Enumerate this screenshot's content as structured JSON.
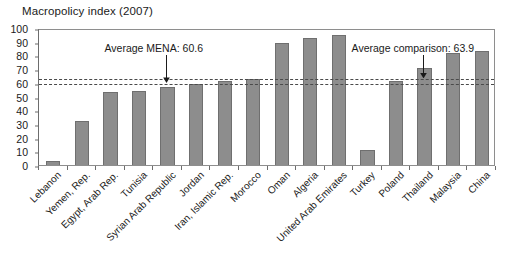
{
  "chart_data": {
    "type": "bar",
    "title": "Macropolicy index (2007)",
    "xlabel": "",
    "ylabel": "",
    "ylim": [
      0,
      100
    ],
    "ytick_step": 10,
    "yticks": [
      0,
      10,
      20,
      30,
      40,
      50,
      60,
      70,
      80,
      90,
      100
    ],
    "grid": false,
    "legend": "none",
    "bar_color": "#8d8d8d",
    "bar_edge_color": "#6f6f6f",
    "categories": [
      "Lebanon",
      "Yemen, Rep.",
      "Egypt, Arab Rep.",
      "Tunisia",
      "Syrian Arab Republic",
      "Jordan",
      "Iran, Islamic Rep.",
      "Morocco",
      "Oman",
      "Algeria",
      "United Arab Emirates",
      "Turkey",
      "Poland",
      "Thailand",
      "Malaysia",
      "China"
    ],
    "values": [
      3,
      32,
      53,
      54,
      57,
      59,
      61,
      63,
      89,
      93,
      95,
      11,
      61,
      71,
      82,
      83
    ],
    "reference_lines": [
      {
        "name": "Average MENA",
        "label": "Average MENA: 60.6",
        "value": 60.6,
        "style": "dashed",
        "color": "#4a4a4a",
        "annotation_x_category": "Syrian Arab Republic"
      },
      {
        "name": "Average comparison",
        "label": "Average comparison: 63.9",
        "value": 63.9,
        "style": "dashed",
        "color": "#4a4a4a",
        "annotation_x_category": "Thailand"
      }
    ]
  },
  "annotations": {
    "mena_label": "Average MENA: 60.6",
    "comparison_label": "Average comparison: 63.9"
  }
}
